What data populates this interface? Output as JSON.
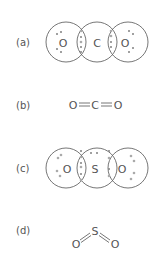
{
  "figure": {
    "panels": [
      {
        "label": "(a)",
        "type": "dot-and-cross",
        "molecule": "CO2",
        "atoms": [
          "O",
          "C",
          "O"
        ]
      },
      {
        "label": "(b)",
        "type": "structural-formula",
        "formula": [
          "O",
          "=",
          "C",
          "=",
          "O"
        ],
        "atoms": [
          "O",
          "C",
          "O"
        ]
      },
      {
        "label": "(c)",
        "type": "dot-and-cross",
        "molecule": "SO2",
        "atoms": [
          "O",
          "S",
          "O"
        ]
      },
      {
        "label": "(d)",
        "type": "structural-formula-bent",
        "atoms": [
          "O",
          "S",
          "O"
        ]
      }
    ]
  },
  "colors": {
    "line": "#666666",
    "text": "#555555",
    "dot": "#aaaaaa",
    "cross": "#888888"
  }
}
